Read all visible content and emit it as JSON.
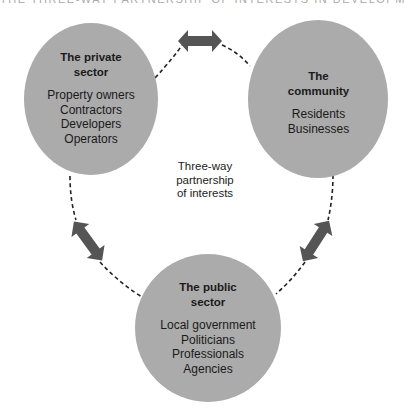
{
  "caption_cropped": "THE THREE-WAY PARTNERSHIP OF INTERESTS IN DEVELOPMENT",
  "colors": {
    "circle_fill": "#ababab",
    "arrow_fill": "#555555",
    "dash_stroke": "#222222",
    "background": "#ffffff"
  },
  "center_label": {
    "line1": "Three-way",
    "line2": "partnership",
    "line3": "of interests"
  },
  "nodes": {
    "private": {
      "title1": "The private",
      "title2": "sector",
      "items": [
        "Property owners",
        "Contractors",
        "Developers",
        "Operators"
      ]
    },
    "community": {
      "title1": "The",
      "title2": "community",
      "items": [
        "Residents",
        "Businesses"
      ]
    },
    "public": {
      "title1": "The public",
      "title2": "sector",
      "items": [
        "Local government",
        "Politicians",
        "Professionals",
        "Agencies"
      ]
    }
  },
  "arrows": [
    {
      "name": "private-community",
      "icon": "double-arrow-icon"
    },
    {
      "name": "private-public",
      "icon": "double-arrow-icon"
    },
    {
      "name": "community-public",
      "icon": "double-arrow-icon"
    }
  ]
}
